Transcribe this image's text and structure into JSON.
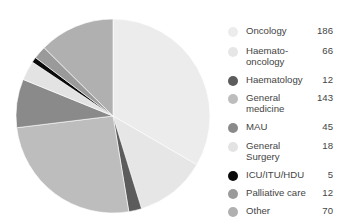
{
  "chart_data": {
    "type": "pie",
    "title": "",
    "start_angle_deg": 0,
    "direction": "clockwise",
    "categories": [
      "Oncology",
      "Haemato-oncology",
      "Haematology",
      "General medicine",
      "MAU",
      "General Surgery",
      "ICU/ITU/HDU",
      "Palliative care",
      "Other"
    ],
    "values": [
      186,
      66,
      12,
      143,
      45,
      18,
      5,
      12,
      70
    ],
    "colors": [
      "#ececec",
      "#e6e6e6",
      "#5c5c5c",
      "#bdbdbd",
      "#8a8a8a",
      "#e3e3e3",
      "#0a0a0a",
      "#9a9a9a",
      "#b0b0b0"
    ],
    "legend_position": "right"
  },
  "legend": [
    {
      "label": "Oncology",
      "value": "186",
      "color": "#ececec",
      "lines": 1
    },
    {
      "label": "Haemato-oncology",
      "line1": "Haemato-",
      "line2": "oncology",
      "value": "66",
      "color": "#e6e6e6",
      "lines": 2
    },
    {
      "label": "Haematology",
      "value": "12",
      "color": "#5c5c5c",
      "lines": 1
    },
    {
      "label": "General medicine",
      "line1": "General",
      "line2": "medicine",
      "value": "143",
      "color": "#bdbdbd",
      "lines": 2
    },
    {
      "label": "MAU",
      "value": "45",
      "color": "#8a8a8a",
      "lines": 1
    },
    {
      "label": "General Surgery",
      "line1": "General",
      "line2": "Surgery",
      "value": "18",
      "color": "#e3e3e3",
      "lines": 2
    },
    {
      "label": "ICU/ITU/HDU",
      "value": "5",
      "color": "#0a0a0a",
      "lines": 1
    },
    {
      "label": "Palliative care",
      "value": "12",
      "color": "#9a9a9a",
      "lines": 1
    },
    {
      "label": "Other",
      "value": "70",
      "color": "#b0b0b0",
      "lines": 1
    }
  ]
}
